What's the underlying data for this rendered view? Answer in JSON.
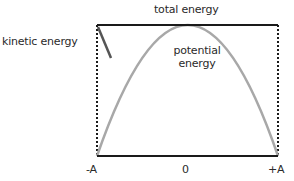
{
  "diagram": {
    "labels": {
      "total_energy": "total energy",
      "kinetic_energy": "kinetic energy",
      "potential_energy_line1": "potential",
      "potential_energy_line2": "energy",
      "x_neg": "-A",
      "x_zero": "0",
      "x_pos": "+A"
    },
    "colors": {
      "total_energy_line": "#1a1a1a",
      "potential_curve": "#a8a8a8",
      "kinetic_line": "#555555",
      "dotted_bounds": "#1a1a1a",
      "baseline": "#1a1a1a"
    },
    "geometry": {
      "x_left": 97,
      "x_right": 278,
      "y_top": 25,
      "y_bottom": 156,
      "peak_x": 188
    }
  }
}
